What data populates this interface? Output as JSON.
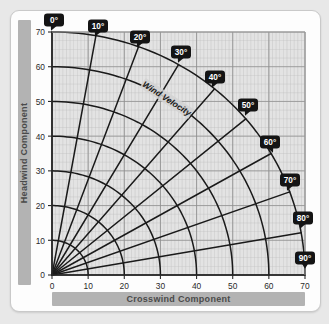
{
  "chart_data": {
    "type": "line",
    "title": "",
    "subtitle": "",
    "xlabel": "Crosswind Component",
    "ylabel": "Headwind Component",
    "xlim": [
      0,
      70
    ],
    "ylim": [
      0,
      70
    ],
    "xticks": [
      0,
      10,
      20,
      30,
      40,
      50,
      60,
      70
    ],
    "yticks": [
      0,
      10,
      20,
      30,
      40,
      50,
      60,
      70
    ],
    "grid": true,
    "legend": null,
    "coordinate_system": "polar-overlay-on-cartesian",
    "annotations": [
      {
        "text": "Wind Velocity",
        "placement": "along-60-unit-arc",
        "rotated": true
      }
    ],
    "radial_lines": {
      "label": "Wind angle off the nose (degrees)",
      "unit": "degrees",
      "values": [
        0,
        10,
        20,
        30,
        40,
        50,
        60,
        70,
        80,
        90
      ],
      "max_radius": 70,
      "note": "Crosswind = V*sin(angle), Headwind = V*cos(angle)"
    },
    "velocity_arcs": {
      "label": "Wind velocity (knots)",
      "unit": "knots",
      "values": [
        10,
        20,
        30,
        40,
        50,
        60,
        70
      ]
    },
    "series": [
      {
        "name": "0°",
        "angle_deg": 0,
        "endpoint": {
          "crosswind": 0.0,
          "headwind": 70.0
        }
      },
      {
        "name": "10°",
        "angle_deg": 10,
        "endpoint": {
          "crosswind": 12.2,
          "headwind": 68.9
        }
      },
      {
        "name": "20°",
        "angle_deg": 20,
        "endpoint": {
          "crosswind": 23.9,
          "headwind": 65.8
        }
      },
      {
        "name": "30°",
        "angle_deg": 30,
        "endpoint": {
          "crosswind": 35.0,
          "headwind": 60.6
        }
      },
      {
        "name": "40°",
        "angle_deg": 40,
        "endpoint": {
          "crosswind": 45.0,
          "headwind": 53.6
        }
      },
      {
        "name": "50°",
        "angle_deg": 50,
        "endpoint": {
          "crosswind": 53.6,
          "headwind": 45.0
        }
      },
      {
        "name": "60°",
        "angle_deg": 60,
        "endpoint": {
          "crosswind": 60.6,
          "headwind": 35.0
        }
      },
      {
        "name": "70°",
        "angle_deg": 70,
        "endpoint": {
          "crosswind": 65.8,
          "headwind": 23.9
        }
      },
      {
        "name": "80°",
        "angle_deg": 80,
        "endpoint": {
          "crosswind": 68.9,
          "headwind": 12.2
        }
      },
      {
        "name": "90°",
        "angle_deg": 90,
        "endpoint": {
          "crosswind": 70.0,
          "headwind": 0.0
        }
      }
    ]
  },
  "axes": {
    "y": {
      "title": "Headwind Component",
      "ticks": [
        "0",
        "10",
        "20",
        "30",
        "40",
        "50",
        "60",
        "70"
      ]
    },
    "x": {
      "title": "Crosswind Component",
      "ticks": [
        "0",
        "10",
        "20",
        "30",
        "40",
        "50",
        "60",
        "70"
      ]
    }
  },
  "angle_badges": [
    {
      "label": "0°"
    },
    {
      "label": "10°"
    },
    {
      "label": "20°"
    },
    {
      "label": "30°"
    },
    {
      "label": "40°"
    },
    {
      "label": "50°"
    },
    {
      "label": "60°"
    },
    {
      "label": "70°"
    },
    {
      "label": "80°"
    },
    {
      "label": "90°"
    }
  ],
  "annotation": {
    "wind_velocity": "Wind Velocity"
  },
  "colors": {
    "page_background": "#e8e8e8",
    "card_background": "#fdfdfd",
    "plot_background": "#e3e3e3",
    "grid_minor": "#bdbdbd",
    "grid_major": "#8f8f8f",
    "curve": "#1a1a1a",
    "badge_fill": "#141414",
    "badge_text": "#ffffff",
    "axis_label_bar": "#b3b3b3",
    "axis_label_text": "#4a4a4a",
    "tick_text": "#2b2b2b"
  }
}
